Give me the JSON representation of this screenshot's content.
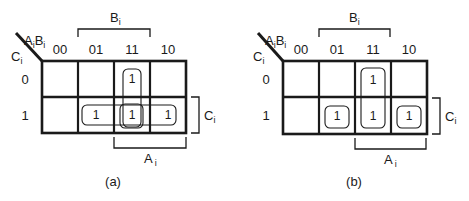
{
  "diagrams": [
    {
      "caption": "(a)",
      "row_var": "C",
      "row_var_sub": "i",
      "col_var_a": "A",
      "col_var_a_sub": "i",
      "col_var_b": "B",
      "col_var_b_sub": "i",
      "col_headers": [
        "00",
        "01",
        "11",
        "10"
      ],
      "row_headers": [
        "0",
        "1"
      ],
      "cells": [
        [
          "",
          "",
          "1",
          ""
        ],
        [
          "",
          "1",
          "1",
          "1"
        ]
      ],
      "bracket_top": {
        "label": "B",
        "sub": "i"
      },
      "bracket_bottom": {
        "label": "A",
        "sub": "i"
      },
      "bracket_right": {
        "label": "C",
        "sub": "i"
      },
      "groupings": [
        "vertical pair column 11",
        "row 1 columns 01-11-10 (horizontal triple)",
        "single at row 1 column 11"
      ]
    },
    {
      "caption": "(b)",
      "row_var": "C",
      "row_var_sub": "i",
      "col_var_a": "A",
      "col_var_a_sub": "i",
      "col_var_b": "B",
      "col_var_b_sub": "i",
      "col_headers": [
        "00",
        "01",
        "11",
        "10"
      ],
      "row_headers": [
        "0",
        "1"
      ],
      "cells": [
        [
          "",
          "",
          "1",
          ""
        ],
        [
          "",
          "1",
          "1",
          "1"
        ]
      ],
      "bracket_top": {
        "label": "B",
        "sub": "i"
      },
      "bracket_bottom": {
        "label": "A",
        "sub": "i"
      },
      "bracket_right": {
        "label": "C",
        "sub": "i"
      },
      "groupings": [
        "single at row 1 column 01",
        "vertical pair column 11",
        "single at row 1 column 10"
      ]
    }
  ]
}
